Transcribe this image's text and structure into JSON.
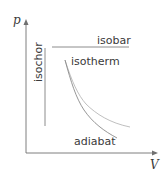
{
  "axes": {
    "y_label": "p",
    "x_label": "V"
  },
  "processes": {
    "isobar": "isobar",
    "isochor": "isochor",
    "isotherm": "isotherm",
    "adiabat": "adiabat"
  },
  "colors": {
    "axis": "#707070",
    "line": "#808080",
    "isotherm_curve": "#b8b8b8",
    "adiabat_curve": "#8a8a8a",
    "text": "#3a3a3a"
  }
}
